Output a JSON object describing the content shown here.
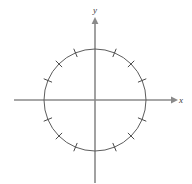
{
  "figure": {
    "background_color": "#ffffff",
    "width": 192,
    "height": 184
  },
  "axes": {
    "x_axis": {
      "label": "x",
      "color": "#8a8a8a",
      "start_x": 14,
      "end_x": 176,
      "y": 100,
      "arrow": "right"
    },
    "y_axis": {
      "label": "y",
      "color": "#8a8a8a",
      "x": 95,
      "start_y": 183,
      "end_y": 20,
      "arrow": "up"
    },
    "origin": {
      "x": 95,
      "y": 100
    }
  },
  "circle": {
    "center_x": 95,
    "center_y": 100,
    "radius": 51,
    "stroke_color": "#5d5d5d",
    "stroke_width": 1,
    "fill": "none"
  },
  "ticks": {
    "count": 12,
    "spacing_degrees": 22.5,
    "length": 9,
    "color": "#4a4a4a",
    "stroke_width": 1,
    "angles_degrees": [
      22.5,
      45,
      67.5,
      112.5,
      135,
      157.5,
      202.5,
      225,
      247.5,
      292.5,
      315,
      337.5
    ]
  },
  "chart_data": {
    "type": "scatter",
    "xlabel": "x",
    "ylabel": "y",
    "grid": false,
    "legend": null,
    "xlim": [
      -1.6,
      1.6
    ],
    "ylim": [
      -1.6,
      1.6
    ],
    "series": [
      {
        "name": "unit circle",
        "kind": "circle",
        "center": [
          0,
          0
        ],
        "radius": 1
      },
      {
        "name": "tick marks",
        "kind": "radial-ticks",
        "angles_degrees": [
          22.5,
          45,
          67.5,
          112.5,
          135,
          157.5,
          202.5,
          225,
          247.5,
          292.5,
          315,
          337.5
        ],
        "radius": 1
      }
    ]
  }
}
